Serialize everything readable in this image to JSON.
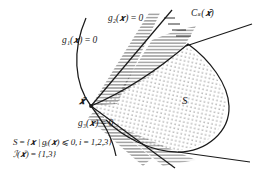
{
  "figure": {
    "type": "constraint-set-diagram",
    "background": "#ffffff",
    "ink": "#1a1a1a",
    "labels": {
      "g1": "g₁(𝒙) = 0",
      "g2": "g₂(𝒙) = 0",
      "g3": "g₃(𝒙) = 0",
      "cone": "Cₛ(𝒙̄)",
      "region": "S",
      "point": "𝒙̄",
      "set_def": "S = {𝒙 | gᵢ(𝒙) ⩽ 0, i = 1,2,3}",
      "active_set": "ℐ(𝒙̄) = {1,3}"
    },
    "shading": {
      "feasible_fill": "stipple-dots",
      "infeasible_fill": "horizontal-hatch"
    }
  }
}
